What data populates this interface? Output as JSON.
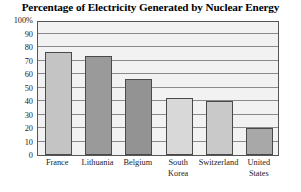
{
  "chart_data": {
    "type": "bar",
    "title": "Percentage of Electricity Generated by Nuclear Energy",
    "xlabel": "",
    "ylabel": "",
    "categories": [
      "France",
      "Lithuania",
      "Belgium",
      "South Korea",
      "Switzerland",
      "United States"
    ],
    "values": [
      76,
      73,
      56,
      42,
      40,
      20
    ],
    "ylim": [
      0,
      100
    ],
    "y_ticks": [
      0,
      10,
      20,
      30,
      40,
      50,
      60,
      70,
      80,
      90,
      100
    ],
    "y_tick_labels": [
      "0",
      "10",
      "20",
      "30",
      "40",
      "50",
      "60",
      "70",
      "80",
      "90",
      "100%"
    ],
    "grid": true,
    "legend": "none",
    "bar_colors": [
      "#c4c4c4",
      "#9a9a9a",
      "#939393",
      "#d8d8d8",
      "#c9c9c9",
      "#a8a8a8"
    ],
    "plot_background": "#f2f2f2",
    "gridline_color": "#8a8a8a",
    "frame_color": "#555555"
  }
}
